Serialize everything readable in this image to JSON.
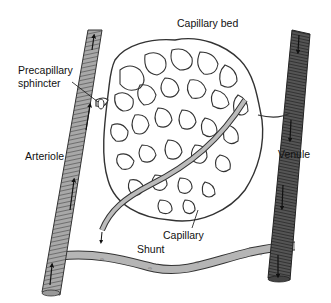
{
  "diagram": {
    "labels": {
      "capillary_bed": "Capillary bed",
      "precapillary_sphincter_line1": "Precapillary",
      "precapillary_sphincter_line2": "sphincter",
      "arteriole": "Arteriole",
      "venule": "Venule",
      "capillary": "Capillary",
      "shunt": "Shunt"
    },
    "nodes": [
      {
        "id": "arteriole",
        "label": "Arteriole",
        "shade": "light-gray",
        "flow": "upward"
      },
      {
        "id": "venule",
        "label": "Venule",
        "shade": "dark-gray",
        "flow": "downward"
      },
      {
        "id": "capillary_bed",
        "label": "Capillary bed",
        "type": "mesh network"
      },
      {
        "id": "precapillary_sphincter",
        "label": "Precapillary sphincter",
        "location": "arteriole-capillary junction"
      },
      {
        "id": "capillary",
        "label": "Capillary",
        "type": "single vessel"
      },
      {
        "id": "shunt",
        "label": "Shunt",
        "connects": [
          "arteriole",
          "venule"
        ]
      }
    ],
    "edges": [
      {
        "from": "arteriole",
        "to": "capillary_bed",
        "via": "precapillary_sphincter"
      },
      {
        "from": "capillary_bed",
        "to": "venule"
      },
      {
        "from": "arteriole",
        "to": "venule",
        "via": "shunt"
      }
    ],
    "colors": {
      "arteriole": "#9a9a9a",
      "venule": "#4a4a4a",
      "shunt": "#b0b0b0",
      "mesh_stroke": "#333333",
      "background": "#ffffff"
    }
  }
}
